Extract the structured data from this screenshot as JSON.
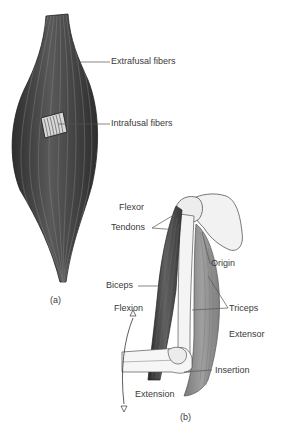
{
  "figure": {
    "panel_a": {
      "caption": "(a)",
      "labels": {
        "extrafusal": "Extrafusal fibers",
        "intrafusal": "Intrafusal fibers"
      }
    },
    "panel_b": {
      "caption": "(b)",
      "labels": {
        "flexor": "Flexor",
        "tendons": "Tendons",
        "origin": "Origin",
        "biceps": "Biceps",
        "flexion": "Flexion",
        "triceps": "Triceps",
        "extensor": "Extensor",
        "insertion": "Insertion",
        "extension": "Extension"
      }
    }
  },
  "colors": {
    "muscle_dark": "#3c3c3c",
    "muscle_mid": "#6a6a6a",
    "triceps": "#8a8a8a",
    "bone": "#f2f2f2",
    "bone_stroke": "#555555",
    "leader": "#555555",
    "text": "#3a3a3a"
  }
}
